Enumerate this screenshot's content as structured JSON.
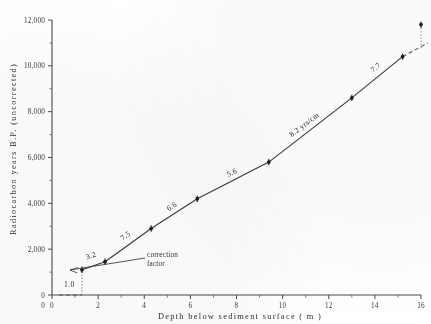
{
  "chart_data": {
    "type": "line",
    "title": "",
    "xlabel": "Depth  below  sediment  surface  ( m )",
    "ylabel": "Radiocarbon  years  B.P.  (uncorrected)",
    "xlim": [
      0,
      16
    ],
    "ylim": [
      0,
      12000
    ],
    "grid": false,
    "legend": "none",
    "x_ticks": [
      0,
      2,
      4,
      6,
      8,
      10,
      12,
      14,
      16
    ],
    "x_tick_labels": [
      "0",
      "2",
      "4",
      "6",
      "8",
      "10",
      "12",
      "14",
      "16"
    ],
    "x_minor_ticks": [
      1,
      3,
      5,
      7,
      9,
      11,
      13,
      15
    ],
    "y_ticks": [
      0,
      2000,
      4000,
      6000,
      8000,
      10000,
      12000
    ],
    "y_tick_labels": [
      "0",
      "2,000",
      "4,000",
      "6,000",
      "8,000",
      "10,000",
      "12,000"
    ],
    "y_minor_ticks": [
      1000,
      3000,
      5000,
      7000,
      9000,
      11000
    ],
    "series": [
      {
        "name": "radiocarbon age vs depth",
        "x": [
          1.3,
          2.3,
          4.3,
          6.3,
          9.4,
          13.0,
          15.2
        ],
        "y": [
          1100,
          1450,
          2900,
          4200,
          5800,
          8600,
          10400
        ]
      },
      {
        "name": "extrapolated trend (dashed)",
        "x": [
          15.2,
          16.3
        ],
        "y": [
          10400,
          11000
        ]
      },
      {
        "name": "outlier point",
        "x": [
          16.0
        ],
        "y": [
          11800
        ]
      },
      {
        "name": "correction factor baseline (dashed)",
        "x": [
          0.3,
          1.3
        ],
        "y": [
          0,
          0
        ]
      }
    ],
    "segment_labels": [
      {
        "text": "1.0",
        "x": 0.75,
        "y": 340
      },
      {
        "text": "3.2",
        "x": 1.72,
        "y": 1620
      },
      {
        "text": "7.5",
        "x": 3.25,
        "y": 2500
      },
      {
        "text": "6.6",
        "x": 5.25,
        "y": 3780
      },
      {
        "text": "5.6",
        "x": 7.85,
        "y": 5250
      },
      {
        "text": "8.2 yrs/cm",
        "x": 11.0,
        "y": 7350
      },
      {
        "text": "7.7",
        "x": 14.1,
        "y": 9850
      }
    ],
    "annotations": [
      {
        "name": "correction-factor",
        "line1": "correction",
        "line2": "factor",
        "x": 3.1,
        "y": 760
      }
    ],
    "colors": {
      "line": "#3d3d3d",
      "axis": "#4a4a4a",
      "marker": "#1d1d1d",
      "text": "#2e2e2e",
      "background": "#ffffff"
    }
  }
}
